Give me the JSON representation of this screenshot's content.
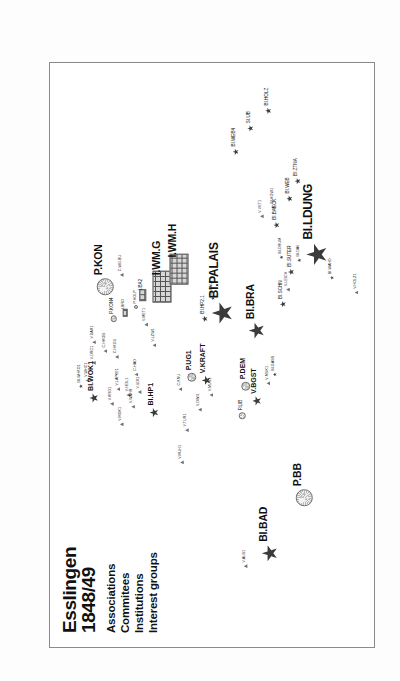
{
  "figure": {
    "title_line1": "Esslingen",
    "title_line2": "1848/49",
    "caption": "Figure 2. The landscape of activities in Esslingen",
    "legend": [
      {
        "key": "associations",
        "label": "Associations",
        "marker": "star-icon"
      },
      {
        "key": "commitees",
        "label": "Commitees",
        "marker": "triangle-icon"
      },
      {
        "key": "institutions",
        "label": "Institutions",
        "marker": "circle-icon"
      },
      {
        "key": "interest_groups",
        "label": "Interest groups",
        "marker": "grid-icon"
      }
    ],
    "colors": {
      "marker_dark": "#3b3b3b",
      "marker_grey": "#6f6f6f",
      "frame": "#8a8a8a",
      "background": "#ffffff",
      "text": "#111111"
    }
  },
  "chart_data": {
    "type": "scatter",
    "title": "Esslingen 1848/49",
    "xlabel": "",
    "ylabel": "",
    "xlim": [
      0,
      100
    ],
    "ylim": [
      0,
      100
    ],
    "grid": false,
    "legend_position": "top-left",
    "series": [
      {
        "name": "Associations",
        "marker": "star",
        "color": "#3b3b3b"
      },
      {
        "name": "Commitees",
        "marker": "triangle",
        "color": "#6f6f6f"
      },
      {
        "name": "Institutions",
        "marker": "circle",
        "color": "#c8c8c8"
      },
      {
        "name": "Interest groups",
        "marker": "grid",
        "color": "#d7d7d7"
      }
    ],
    "points": [
      {
        "label": "BI.BAD",
        "series": "Associations",
        "x": 16.0,
        "y": 32.5,
        "size": "l"
      },
      {
        "label": "V.ALB1",
        "series": "Commitees",
        "x": 13.8,
        "y": 40.0,
        "size": "xs"
      },
      {
        "label": "P.BB",
        "series": "Institutions",
        "x": 25.5,
        "y": 22.0,
        "size": "l"
      },
      {
        "label": "V.HOLZ1",
        "series": "Commitees",
        "x": 60.5,
        "y": 6.0,
        "size": "xs"
      },
      {
        "label": "BI.GASS",
        "series": "Associations",
        "x": 46.5,
        "y": 31.0,
        "size": "xs"
      },
      {
        "label": "V.MUH1",
        "series": "Commitees",
        "x": 31.5,
        "y": 59.5,
        "size": "xs"
      },
      {
        "label": "V.BGST",
        "series": "Associations",
        "x": 42.0,
        "y": 36.5,
        "size": "m"
      },
      {
        "label": "P.LIB",
        "series": "Institutions",
        "x": 39.5,
        "y": 41.0,
        "size": "s"
      },
      {
        "label": "P.DEM",
        "series": "Institutions",
        "x": 44.5,
        "y": 40.0,
        "size": "m"
      },
      {
        "label": "V.MUK1",
        "series": "Commitees",
        "x": 45.0,
        "y": 33.0,
        "size": "xs"
      },
      {
        "label": "V.KRAFT",
        "series": "Associations",
        "x": 45.5,
        "y": 52.0,
        "size": "m"
      },
      {
        "label": "P.UG1",
        "series": "Institutions",
        "x": 46.0,
        "y": 56.5,
        "size": "m"
      },
      {
        "label": "C.KNU",
        "series": "Commitees",
        "x": 44.0,
        "y": 60.0,
        "size": "xs"
      },
      {
        "label": "V.DWI1",
        "series": "Commitees",
        "x": 40.5,
        "y": 54.0,
        "size": "xs"
      },
      {
        "label": "V.TUR1",
        "series": "Commitees",
        "x": 37.0,
        "y": 58.0,
        "size": "xs"
      },
      {
        "label": "V.MUS1",
        "series": "Commitees",
        "x": 43.0,
        "y": 50.5,
        "size": "xs"
      },
      {
        "label": "BI.BRA",
        "series": "Associations",
        "x": 54.0,
        "y": 36.5,
        "size": "l"
      },
      {
        "label": "BI.PALAIS",
        "series": "Associations",
        "x": 57.0,
        "y": 47.0,
        "size": "xl"
      },
      {
        "label": "BI.HP2.1",
        "series": "Associations",
        "x": 56.0,
        "y": 52.5,
        "size": "s"
      },
      {
        "label": "BI.BAU1",
        "series": "Associations",
        "x": 59.5,
        "y": 50.0,
        "size": "xs"
      },
      {
        "label": "BI.SCHN",
        "series": "Associations",
        "x": 58.5,
        "y": 28.5,
        "size": "s"
      },
      {
        "label": "V.LEICH",
        "series": "Commitees",
        "x": 61.0,
        "y": 27.0,
        "size": "xs"
      },
      {
        "label": "BI.LDUNG",
        "series": "Associations",
        "x": 67.0,
        "y": 18.0,
        "size": "xl"
      },
      {
        "label": "BI.WAHD",
        "series": "Associations",
        "x": 63.0,
        "y": 13.5,
        "size": "xs"
      },
      {
        "label": "BI.DAV",
        "series": "Associations",
        "x": 66.0,
        "y": 23.5,
        "size": "xs"
      },
      {
        "label": "BI.SUTER",
        "series": "Associations",
        "x": 64.0,
        "y": 26.0,
        "size": "s"
      },
      {
        "label": "BI.DRUM",
        "series": "Associations",
        "x": 66.5,
        "y": 29.0,
        "size": "xs"
      },
      {
        "label": "BI.BAECK",
        "series": "Associations",
        "x": 72.0,
        "y": 30.5,
        "size": "s"
      },
      {
        "label": "V.VET1",
        "series": "Commitees",
        "x": 73.5,
        "y": 35.0,
        "size": "xs"
      },
      {
        "label": "BI.WEB",
        "series": "Associations",
        "x": 76.5,
        "y": 26.5,
        "size": "s"
      },
      {
        "label": "SI.HOW1",
        "series": "Associations",
        "x": 75.0,
        "y": 31.5,
        "size": "xs"
      },
      {
        "label": "BI.ZTNA",
        "series": "Associations",
        "x": 79.5,
        "y": 24.0,
        "size": "s"
      },
      {
        "label": "BI.WEB4",
        "series": "Associations",
        "x": 84.5,
        "y": 43.0,
        "size": "s"
      },
      {
        "label": "SI.UB",
        "series": "Associations",
        "x": 88.5,
        "y": 38.5,
        "size": "s"
      },
      {
        "label": "BI.HOLZ",
        "series": "Associations",
        "x": 91.5,
        "y": 33.0,
        "size": "s"
      },
      {
        "label": "I.WM.G",
        "series": "Interest groups",
        "x": 61.5,
        "y": 65.5,
        "size": "l"
      },
      {
        "label": "I.WM.H",
        "series": "Interest groups",
        "x": 64.5,
        "y": 60.5,
        "size": "l"
      },
      {
        "label": "I.BA2",
        "series": "Interest groups",
        "x": 60.0,
        "y": 71.5,
        "size": "s"
      },
      {
        "label": "I.BRO",
        "series": "Interest groups",
        "x": 57.0,
        "y": 77.0,
        "size": "xs"
      },
      {
        "label": "V.LZW1",
        "series": "Commitees",
        "x": 51.5,
        "y": 68.0,
        "size": "xs"
      },
      {
        "label": "V.MET1",
        "series": "Commitees",
        "x": 55.0,
        "y": 70.5,
        "size": "xs"
      },
      {
        "label": "P.HOLP",
        "series": "Institutions",
        "x": 58.0,
        "y": 73.5,
        "size": "xs"
      },
      {
        "label": "P.KON4",
        "series": "Institutions",
        "x": 56.0,
        "y": 80.5,
        "size": "s"
      },
      {
        "label": "P.KON",
        "series": "Institutions",
        "x": 61.5,
        "y": 83.0,
        "size": "l"
      },
      {
        "label": "C.WG.BU",
        "series": "Commitees",
        "x": 63.5,
        "y": 78.0,
        "size": "xs"
      },
      {
        "label": "C.HKOU",
        "series": "Commitees",
        "x": 49.5,
        "y": 79.5,
        "size": "xs"
      },
      {
        "label": "C.HKOB",
        "series": "Commitees",
        "x": 50.5,
        "y": 83.0,
        "size": "xs"
      },
      {
        "label": "V.DAR1",
        "series": "Commitees",
        "x": 52.0,
        "y": 86.5,
        "size": "xs"
      },
      {
        "label": "V.DRC1",
        "series": "Commitees",
        "x": 48.5,
        "y": 86.5,
        "size": "xs"
      },
      {
        "label": "V.WHC1",
        "series": "Commitees",
        "x": 45.5,
        "y": 88.5,
        "size": "xs"
      },
      {
        "label": "BI.WHKO1",
        "series": "Associations",
        "x": 44.5,
        "y": 90.5,
        "size": "xs"
      },
      {
        "label": "BI.WOK1",
        "series": "Associations",
        "x": 42.5,
        "y": 86.5,
        "size": "m"
      },
      {
        "label": "V.KRO1",
        "series": "Commitees",
        "x": 41.5,
        "y": 81.0,
        "size": "xs"
      },
      {
        "label": "V.LAPKE1",
        "series": "Commitees",
        "x": 44.0,
        "y": 79.0,
        "size": "xs"
      },
      {
        "label": "V.HEIL1",
        "series": "Commitees",
        "x": 43.0,
        "y": 76.0,
        "size": "xs"
      },
      {
        "label": "V.WAHR",
        "series": "Commitees",
        "x": 41.0,
        "y": 74.5,
        "size": "xs"
      },
      {
        "label": "V.UDI1",
        "series": "Commitees",
        "x": 43.5,
        "y": 72.5,
        "size": "xs"
      },
      {
        "label": "C.HAD",
        "series": "Commitees",
        "x": 46.5,
        "y": 73.5,
        "size": "xs"
      },
      {
        "label": "V.MGK1",
        "series": "Commitees",
        "x": 38.0,
        "y": 78.0,
        "size": "xs"
      },
      {
        "label": "BI.HP1",
        "series": "Associations",
        "x": 40.0,
        "y": 68.0,
        "size": "m"
      }
    ]
  }
}
